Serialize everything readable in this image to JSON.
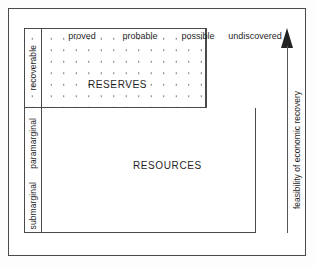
{
  "figure": {
    "area_labels": {
      "reserves": "RESERVES",
      "resources": "RESOURCES"
    },
    "certainty_axis": {
      "labels": [
        "proved",
        "probable",
        "possible",
        "undiscovered"
      ]
    },
    "feasibility_axis": {
      "caption": "feasibility of economic recovery",
      "labels": [
        "recoverable",
        "paramarginal",
        "submarginal"
      ],
      "arrow_direction": "up"
    },
    "colors": {
      "frame": "#4a4a4a",
      "text": "#1f1f1f",
      "stipple_dot": "#6d6d6d",
      "arrow_head": "#232323",
      "arrow_shaft": "#55555a",
      "background": "#ffffff"
    }
  }
}
